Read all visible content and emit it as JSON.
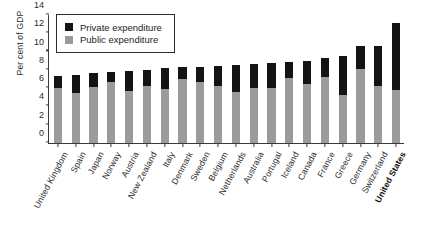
{
  "chart_data": {
    "type": "bar",
    "title": "",
    "xlabel": "",
    "ylabel": "Per cent of GDP",
    "ylim": [
      0,
      14
    ],
    "ytick_step": 2,
    "yticks": [
      0,
      2,
      4,
      6,
      8,
      10,
      12,
      14
    ],
    "grid": false,
    "stacked": true,
    "legend_position": "top-left",
    "categories": [
      "United Kingdom",
      "Spain",
      "Japan",
      "Norway",
      "Austria",
      "New Zealand",
      "Italy",
      "Denmark",
      "Sweden",
      "Belgium",
      "Netherlands",
      "Australia",
      "Portugal",
      "Iceland",
      "Canada",
      "France",
      "Greece",
      "Germany",
      "Switzerland",
      "United States"
    ],
    "series": [
      {
        "name": "Public expenditure",
        "color": "#9b9b9b",
        "values": [
          6.0,
          5.4,
          6.1,
          6.6,
          5.6,
          6.2,
          5.9,
          6.9,
          6.6,
          6.2,
          5.5,
          6.0,
          6.0,
          7.1,
          6.4,
          7.2,
          5.2,
          8.0,
          6.2,
          5.8
        ]
      },
      {
        "name": "Private expenditure",
        "color": "#141414",
        "values": [
          1.3,
          2.0,
          1.5,
          1.1,
          2.2,
          1.7,
          2.2,
          1.4,
          1.7,
          2.2,
          3.0,
          2.6,
          2.7,
          1.7,
          2.5,
          2.0,
          4.2,
          2.5,
          4.3,
          7.2
        ]
      }
    ],
    "totals": [
      7.3,
      7.4,
      7.6,
      7.7,
      7.8,
      7.9,
      8.1,
      8.3,
      8.3,
      8.4,
      8.5,
      8.6,
      8.7,
      8.8,
      8.9,
      9.2,
      9.4,
      10.5,
      10.5,
      13.0
    ],
    "highlight_category": "United States"
  },
  "legend": {
    "items": [
      {
        "label": "Private expenditure",
        "swatch": "private"
      },
      {
        "label": "Public expenditure",
        "swatch": "public"
      }
    ]
  },
  "axis": {
    "y_title": "Per cent of GDP"
  },
  "footer": {
    "source": ""
  },
  "colors": {
    "public": "#9b9b9b",
    "private": "#141414",
    "axis": "#3a3a3a",
    "background": "#ffffff"
  }
}
